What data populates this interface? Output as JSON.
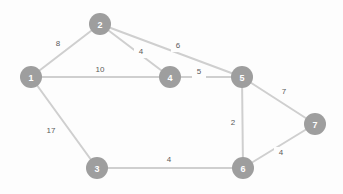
{
  "diagram": {
    "type": "node-link-graph",
    "canvas": {
      "width": 343,
      "height": 194,
      "background": "#fdfdfd"
    },
    "style": {
      "node_fill": "#9e9e9e",
      "node_label_color": "#ffffff",
      "edge_color": "#cfcfcf",
      "edge_weight_color": "#5b5b5b",
      "node_radius": 11
    },
    "nodes": [
      {
        "id": "1",
        "label": "1",
        "x": 31,
        "y": 77
      },
      {
        "id": "2",
        "label": "2",
        "x": 100,
        "y": 24
      },
      {
        "id": "3",
        "label": "3",
        "x": 97,
        "y": 168
      },
      {
        "id": "4",
        "label": "4",
        "x": 170,
        "y": 77
      },
      {
        "id": "5",
        "label": "5",
        "x": 242,
        "y": 77
      },
      {
        "id": "6",
        "label": "6",
        "x": 243,
        "y": 168
      },
      {
        "id": "7",
        "label": "7",
        "x": 315,
        "y": 124
      }
    ],
    "edges": [
      {
        "from": "1",
        "to": "2",
        "weight": "8",
        "x1": 31,
        "y1": 77,
        "x2": 100,
        "y2": 24,
        "lx": 58,
        "ly": 44
      },
      {
        "from": "1",
        "to": "4",
        "weight": "10",
        "x1": 31,
        "y1": 77,
        "x2": 170,
        "y2": 77,
        "lx": 100,
        "ly": 70
      },
      {
        "from": "1",
        "to": "3",
        "weight": "17",
        "x1": 31,
        "y1": 77,
        "x2": 97,
        "y2": 168,
        "lx": 51,
        "ly": 131
      },
      {
        "from": "2",
        "to": "4",
        "weight": "4",
        "x1": 100,
        "y1": 24,
        "x2": 170,
        "y2": 77,
        "lx": 141,
        "ly": 52
      },
      {
        "from": "2",
        "to": "5",
        "weight": "6",
        "x1": 100,
        "y1": 24,
        "x2": 242,
        "y2": 77,
        "lx": 178,
        "ly": 46
      },
      {
        "from": "4",
        "to": "5",
        "weight": "5",
        "x1": 170,
        "y1": 77,
        "x2": 242,
        "y2": 77,
        "lx": 199,
        "ly": 72
      },
      {
        "from": "5",
        "to": "7",
        "weight": "7",
        "x1": 242,
        "y1": 77,
        "x2": 315,
        "y2": 124,
        "lx": 284,
        "ly": 92
      },
      {
        "from": "5",
        "to": "6",
        "weight": "2",
        "x1": 242,
        "y1": 77,
        "x2": 243,
        "y2": 168,
        "lx": 233,
        "ly": 123
      },
      {
        "from": "3",
        "to": "6",
        "weight": "4",
        "x1": 97,
        "y1": 168,
        "x2": 243,
        "y2": 168,
        "lx": 169,
        "ly": 160
      },
      {
        "from": "6",
        "to": "7",
        "weight": "4",
        "x1": 243,
        "y1": 168,
        "x2": 315,
        "y2": 124,
        "lx": 281,
        "ly": 153
      }
    ]
  }
}
